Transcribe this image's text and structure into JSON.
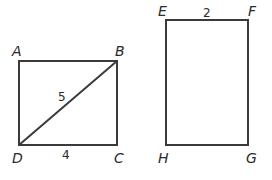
{
  "figures": {
    "rectangle_abcd": {
      "vertices": {
        "A": "A",
        "B": "B",
        "C": "C",
        "D": "D"
      },
      "measurements": {
        "diagonal_BD": "5",
        "side_DC": "4"
      }
    },
    "rectangle_efgh": {
      "vertices": {
        "E": "E",
        "F": "F",
        "G": "G",
        "H": "H"
      },
      "measurements": {
        "side_EF": "2"
      }
    }
  },
  "colors": {
    "line": "#3a3a3a",
    "text": "#2a2a2a",
    "background": "#ffffff"
  }
}
